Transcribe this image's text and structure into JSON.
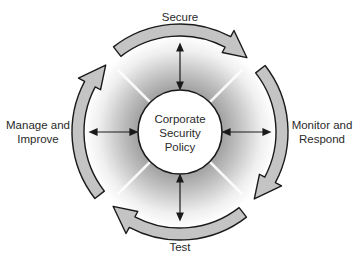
{
  "diagram": {
    "center": {
      "lines": [
        "Corporate",
        "Security",
        "Policy"
      ]
    },
    "stages": [
      {
        "id": "secure",
        "lines": [
          "Secure"
        ],
        "position": "top"
      },
      {
        "id": "monitor",
        "lines": [
          "Monitor and",
          "Respond"
        ],
        "position": "right"
      },
      {
        "id": "test",
        "lines": [
          "Test"
        ],
        "position": "bottom"
      },
      {
        "id": "manage",
        "lines": [
          "Manage and",
          "Improve"
        ],
        "position": "left"
      }
    ],
    "colors": {
      "arrow_fill": "#c4c4c4",
      "arrow_stroke": "#1a1a1a",
      "ring_inner": "#a8a8a8",
      "ring_outer": "#ffffff",
      "center_fill": "#ffffff"
    }
  }
}
